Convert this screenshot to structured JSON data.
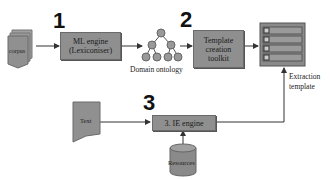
{
  "diagram": {
    "steps": [
      {
        "number": "1",
        "label_line1": "ML engine",
        "label_line2": "(Lexiconiser)"
      },
      {
        "number": "2",
        "label_line1": "Template",
        "label_line2": "creation",
        "label_line3": "toolkit"
      },
      {
        "number": "3",
        "label": "3. IE engine"
      }
    ],
    "inputs": {
      "corpus": "corpus",
      "text": "Text",
      "resources": "Resources"
    },
    "outputs": {
      "ontology": "Domain ontology",
      "extraction_template_line1": "Extraction",
      "extraction_template_line2": "template"
    },
    "colors": {
      "box_fill": "#8f8f8f",
      "line": "#333333",
      "background": "#ffffff"
    }
  }
}
